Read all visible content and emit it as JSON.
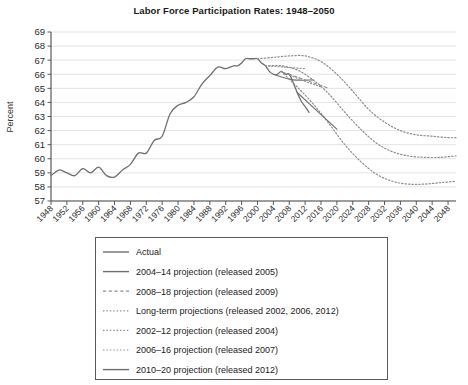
{
  "chart_data": {
    "type": "line",
    "title": "Labor Force Participation Rates: 1948–2050",
    "xlabel": "",
    "ylabel": "Percent",
    "xlim": [
      1948,
      2050
    ],
    "ylim": [
      57,
      69
    ],
    "ytick_step": 1,
    "xtick_step": 4,
    "grid": true,
    "legend_position": "below-plot",
    "ytick_labels": [
      "57",
      "58",
      "59",
      "60",
      "61",
      "62",
      "63",
      "64",
      "65",
      "66",
      "67",
      "68",
      "69"
    ],
    "xtick_labels": [
      "1948",
      "1952",
      "1956",
      "1960",
      "1964",
      "1968",
      "1972",
      "1976",
      "1980",
      "1984",
      "1988",
      "1992",
      "1996",
      "2000",
      "2004",
      "2008",
      "2012",
      "2016",
      "2020",
      "2024",
      "2028",
      "2032",
      "2036",
      "2040",
      "2044",
      "2048"
    ],
    "colors": {
      "line": "#6f6f6f",
      "dotted": "#8d8d8d",
      "grid": "#d8d8d8",
      "axis": "#4a4a4a",
      "text": "#1a1a1a"
    },
    "series": [
      {
        "name": "Actual",
        "style": "solid",
        "width": 1.3,
        "color": "#6f6f6f",
        "x": [
          1948,
          1950,
          1952,
          1954,
          1956,
          1958,
          1960,
          1962,
          1964,
          1966,
          1968,
          1970,
          1972,
          1974,
          1976,
          1978,
          1980,
          1982,
          1984,
          1986,
          1988,
          1990,
          1992,
          1994,
          1995,
          1996,
          1997,
          1998,
          1999,
          2000,
          2001,
          2002,
          2003,
          2004,
          2005,
          2006,
          2007,
          2008,
          2009,
          2010,
          2011,
          2012,
          2013
        ],
        "y": [
          58.8,
          59.2,
          59.0,
          58.8,
          59.3,
          59.0,
          59.4,
          58.8,
          58.7,
          59.2,
          59.6,
          60.4,
          60.4,
          61.3,
          61.6,
          63.2,
          63.8,
          64.0,
          64.4,
          65.3,
          65.9,
          66.5,
          66.4,
          66.6,
          66.6,
          66.8,
          67.1,
          67.1,
          67.1,
          67.1,
          66.8,
          66.6,
          66.2,
          66.0,
          66.0,
          66.2,
          66.0,
          66.0,
          65.4,
          64.7,
          64.1,
          63.7,
          63.3
        ]
      },
      {
        "name": "2004–14 projection (released 2005)",
        "style": "solid",
        "width": 1.1,
        "color": "#6f6f6f",
        "x": [
          2004,
          2009,
          2014
        ],
        "y": [
          66.0,
          65.6,
          65.6
        ]
      },
      {
        "name": "2008–18 projection (released 2009)",
        "style": "dashed",
        "width": 1.1,
        "color": "#8d8d8d",
        "x": [
          2008,
          2013,
          2018
        ],
        "y": [
          66.0,
          65.5,
          65.0
        ]
      },
      {
        "name": "Long-term projections (released 2002, 2006, 2012)",
        "style": "dotted",
        "width": 1.2,
        "color": "#8d8d8d",
        "curves": [
          {
            "label": "released 2002",
            "x": [
              2000,
              2004,
              2008,
              2012,
              2016,
              2020,
              2024,
              2028,
              2032,
              2036,
              2040,
              2044,
              2048,
              2050
            ],
            "y": [
              67.1,
              67.2,
              67.3,
              67.3,
              66.9,
              66.0,
              64.8,
              63.5,
              62.6,
              62.0,
              61.7,
              61.6,
              61.5,
              61.5
            ]
          },
          {
            "label": "released 2006",
            "x": [
              2002,
              2006,
              2010,
              2014,
              2018,
              2022,
              2026,
              2030,
              2034,
              2038,
              2042,
              2046,
              2050
            ],
            "y": [
              66.6,
              66.6,
              66.3,
              65.6,
              64.6,
              63.3,
              62.1,
              61.1,
              60.5,
              60.2,
              60.1,
              60.1,
              60.2
            ]
          },
          {
            "label": "released 2012",
            "x": [
              2006,
              2010,
              2014,
              2018,
              2022,
              2026,
              2030,
              2034,
              2038,
              2042,
              2046,
              2050
            ],
            "y": [
              66.2,
              65.1,
              63.9,
              62.5,
              61.0,
              59.8,
              58.9,
              58.4,
              58.2,
              58.2,
              58.3,
              58.4
            ]
          }
        ]
      },
      {
        "name": "2002–12 projection (released 2004)",
        "style": "dotted",
        "width": 1.1,
        "color": "#8d8d8d",
        "x": [
          2002,
          2007,
          2012
        ],
        "y": [
          66.6,
          66.5,
          66.4
        ]
      },
      {
        "name": "2006–16 projection (released 2007)",
        "style": "dotted",
        "width": 1.1,
        "color": "#8d8d8d",
        "x": [
          2006,
          2011,
          2016
        ],
        "y": [
          66.2,
          65.6,
          65.1
        ]
      },
      {
        "name": "2010–20 projection (released 2012)",
        "style": "solid",
        "width": 1.2,
        "color": "#6f6f6f",
        "x": [
          2010,
          2015,
          2020
        ],
        "y": [
          64.7,
          63.4,
          62.1
        ]
      }
    ]
  },
  "legend": {
    "items": [
      {
        "label": "Actual",
        "style": "solid"
      },
      {
        "label": "2004–14 projection (released 2005)",
        "style": "solid"
      },
      {
        "label": "2008–18 projection (released 2009)",
        "style": "dashed"
      },
      {
        "label": "Long-term projections (released 2002, 2006, 2012)",
        "style": "dotted"
      },
      {
        "label": "2002–12 projection (released 2004)",
        "style": "dotted"
      },
      {
        "label": "2006–16 projection (released 2007)",
        "style": "dotted"
      },
      {
        "label": "2010–20 projection (released 2012)",
        "style": "solid"
      }
    ]
  }
}
